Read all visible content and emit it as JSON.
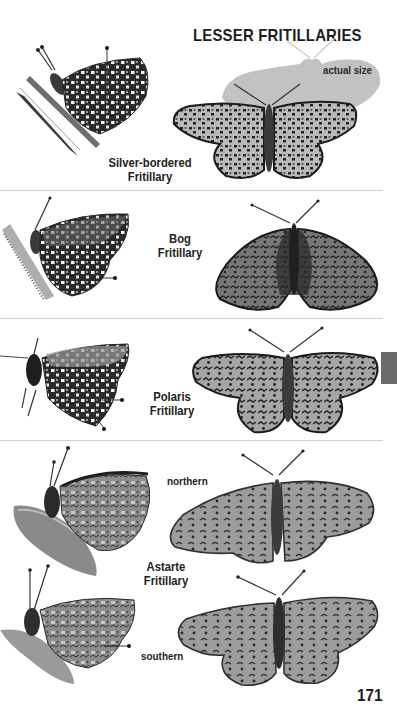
{
  "page": {
    "title": "LESSER FRITILLARIES",
    "actual_size_label": "actual size",
    "page_number": "171",
    "thumb_tab_color": "#6b6b6b",
    "separator_color": "#cfcfcf"
  },
  "species": [
    {
      "name_line1": "Silver-bordered",
      "name_line2": "Fritillary",
      "images": [
        "underside-perched-on-grass",
        "upperside-spread"
      ]
    },
    {
      "name_line1": "Bog",
      "name_line2": "Fritillary",
      "images": [
        "underside-perched",
        "upperside-spread"
      ]
    },
    {
      "name_line1": "Polaris",
      "name_line2": "Fritillary",
      "images": [
        "underside-perched",
        "upperside-spread"
      ]
    },
    {
      "name_line1": "Astarte",
      "name_line2": "Fritillary",
      "forms": [
        {
          "label": "northern",
          "images": [
            "underside-perched",
            "upperside-spread"
          ]
        },
        {
          "label": "southern",
          "images": [
            "underside-perched",
            "upperside-spread"
          ]
        }
      ]
    }
  ]
}
